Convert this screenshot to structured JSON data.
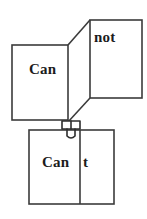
{
  "diagram": {
    "stroke_color": "#3b3b3b",
    "text_color": "#1c1c1c",
    "background_color": "#ffffff",
    "panels": [
      {
        "id": "can",
        "label": "Can",
        "role": "left-upper-sheet"
      },
      {
        "id": "not",
        "label": "not",
        "role": "right-upper-sheet"
      },
      {
        "id": "cant-left",
        "label": "Can",
        "role": "lower-sheet-left-half"
      },
      {
        "id": "cant-right",
        "label": "t",
        "role": "lower-sheet-right-half"
      }
    ],
    "clip": {
      "name": "binder-clip",
      "color": "#2e2e2e"
    }
  }
}
